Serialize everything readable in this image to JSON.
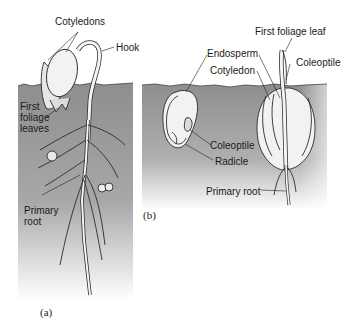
{
  "figure": {
    "panel_a": {
      "caption": "(a)",
      "labels": {
        "cotyledons": "Cotyledons",
        "hook": "Hook",
        "first_foliage_leaves_1": "First",
        "first_foliage_leaves_2": "foliage",
        "first_foliage_leaves_3": "leaves",
        "primary_root_1": "Primary",
        "primary_root_2": "root"
      }
    },
    "panel_b": {
      "caption": "(b)",
      "labels": {
        "first_foliage_leaf": "First foliage leaf",
        "endosperm": "Endosperm",
        "cotyledon": "Cotyledon",
        "coleoptile_right": "Coleoptile",
        "coleoptile_left": "Coleoptile",
        "radicle": "Radicle",
        "primary_root": "Primary root"
      }
    },
    "colors": {
      "soil_top": "#8f8f8f",
      "soil_bottom": "#ffffff",
      "line": "#2a2a2a",
      "seed_fill": "#f2f2f2"
    }
  }
}
